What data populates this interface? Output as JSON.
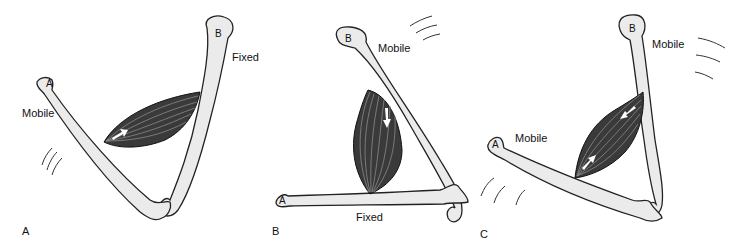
{
  "figure": {
    "panels": [
      {
        "id": "A",
        "panel_label": "A",
        "bone_a_label": "A",
        "bone_b_label": "B",
        "bone_a_state": "Mobile",
        "bone_b_state": "Fixed",
        "arrows": [
          "toward B"
        ]
      },
      {
        "id": "B",
        "panel_label": "B",
        "bone_a_label": "A",
        "bone_b_label": "B",
        "bone_a_state": "Fixed",
        "bone_b_state": "Mobile",
        "arrows": [
          "toward A"
        ]
      },
      {
        "id": "C",
        "panel_label": "C",
        "bone_a_label": "A",
        "bone_b_label": "B",
        "bone_a_state": "Mobile",
        "bone_b_state": "Mobile",
        "arrows": [
          "toward B",
          "toward A"
        ]
      }
    ],
    "colors": {
      "bone_fill": "#ebebeb",
      "muscle_fill": "#3a3a3a",
      "outline": "#222222",
      "arrow": "#ffffff"
    }
  }
}
